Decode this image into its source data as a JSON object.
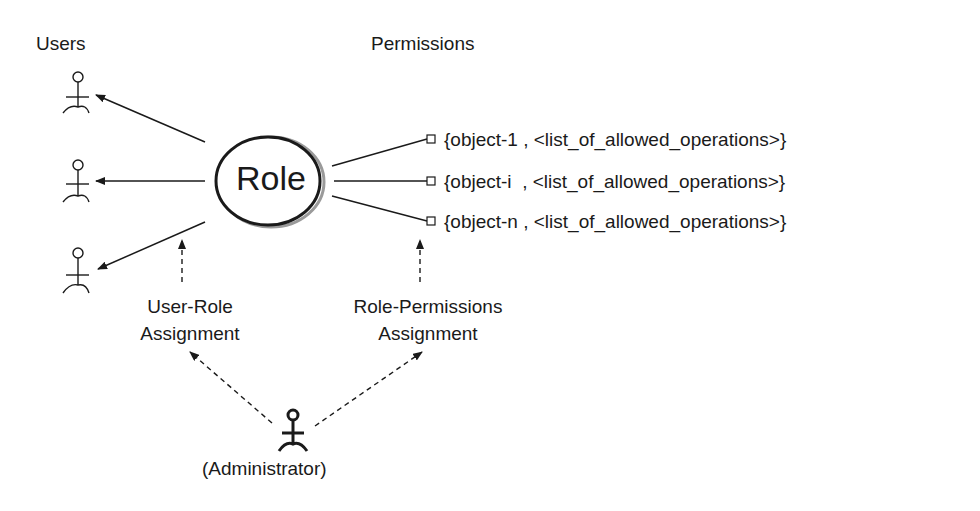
{
  "headers": {
    "users": "Users",
    "permissions": "Permissions"
  },
  "role": {
    "label": "Role"
  },
  "permissions": [
    {
      "label": "{object-1 , <list_of_allowed_operations>}"
    },
    {
      "label": "{object-i  , <list_of_allowed_operations>}"
    },
    {
      "label": "{object-n , <list_of_allowed_operations>}"
    }
  ],
  "assignments": {
    "user_role": {
      "line1": "User-Role",
      "line2": "Assignment"
    },
    "role_permissions": {
      "line1": "Role-Permissions",
      "line2": "Assignment"
    }
  },
  "administrator": {
    "label": "(Administrator)"
  },
  "users": [
    {
      "icon": "actor-icon"
    },
    {
      "icon": "actor-icon"
    },
    {
      "icon": "actor-icon"
    }
  ]
}
